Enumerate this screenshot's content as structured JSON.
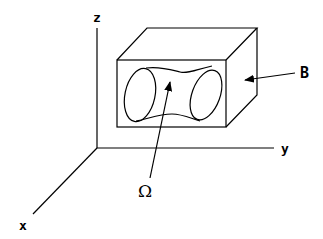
{
  "diagram": {
    "type": "3d-coordinate-illustration",
    "axes": {
      "x": {
        "label": "x"
      },
      "y": {
        "label": "y"
      },
      "z": {
        "label": "z"
      }
    },
    "labels": {
      "box": "B",
      "domain": "Ω"
    },
    "colors": {
      "stroke": "#000000",
      "background": "#ffffff"
    }
  }
}
